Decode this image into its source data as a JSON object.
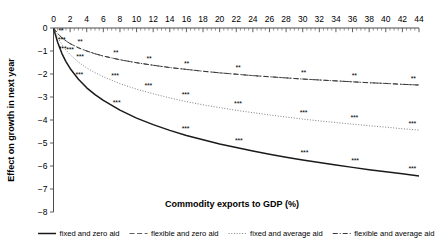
{
  "chart_data": {
    "type": "line",
    "title": "",
    "xlabel": "Commodity exports to GDP (%)",
    "ylabel": "Effect on growth in next year",
    "xlim": [
      0,
      44
    ],
    "ylim": [
      -8,
      0
    ],
    "grid": false,
    "legend_position": "bottom",
    "x_ticks": [
      0,
      2,
      4,
      6,
      8,
      10,
      12,
      14,
      16,
      18,
      20,
      22,
      24,
      26,
      28,
      30,
      32,
      34,
      36,
      38,
      40,
      42,
      44
    ],
    "x_tick_labels": [
      "0",
      "2",
      "4",
      "6",
      "8",
      "10",
      "12",
      "14",
      "16",
      "18",
      "20",
      "22",
      "24",
      "26",
      "28",
      "30",
      "32",
      "34",
      "36",
      "38",
      "40",
      "42",
      "44"
    ],
    "x_minor_tick_step": 0.5,
    "y_ticks": [
      0,
      -1,
      -2,
      -3,
      -4,
      -5,
      -6,
      -7,
      -8
    ],
    "y_tick_labels": [
      "0",
      "−1",
      "−2",
      "−3",
      "−4",
      "−5",
      "−6",
      "−7",
      "−8"
    ],
    "series": [
      {
        "name": "fixed and zero aid",
        "style": "solid",
        "color": "#1a1a1a",
        "x": [
          0,
          0.5,
          1,
          1.5,
          2,
          3,
          4,
          5,
          6,
          8,
          10,
          12,
          14,
          16,
          18,
          20,
          22,
          24,
          26,
          28,
          30,
          32,
          34,
          36,
          38,
          40,
          42,
          44
        ],
        "y": [
          0,
          -0.62,
          -1.1,
          -1.46,
          -1.76,
          -2.23,
          -2.6,
          -2.9,
          -3.15,
          -3.57,
          -3.92,
          -4.2,
          -4.45,
          -4.67,
          -4.86,
          -5.04,
          -5.2,
          -5.35,
          -5.49,
          -5.62,
          -5.74,
          -5.85,
          -5.96,
          -6.06,
          -6.16,
          -6.25,
          -6.34,
          -6.43
        ],
        "annotations": [
          {
            "x": 1.1,
            "y": -1.15,
            "text": "***"
          },
          {
            "x": 3.1,
            "y": -2.28,
            "text": "***"
          },
          {
            "x": 7.6,
            "y": -3.5,
            "text": "***"
          },
          {
            "x": 15.9,
            "y": -4.6,
            "text": "***"
          },
          {
            "x": 22.3,
            "y": -5.15,
            "text": "***"
          },
          {
            "x": 30.2,
            "y": -5.68,
            "text": "***"
          },
          {
            "x": 36.3,
            "y": -6.0,
            "text": "***"
          },
          {
            "x": 43.2,
            "y": -6.36,
            "text": "***"
          }
        ]
      },
      {
        "name": "flexible and zero aid",
        "style": "dashed",
        "color": "#555555",
        "x": [
          0,
          0.5,
          1,
          1.5,
          2,
          3,
          4,
          5,
          6,
          8,
          10,
          12,
          14,
          16,
          18,
          20,
          22,
          24,
          26,
          28,
          30,
          32,
          34,
          36,
          38,
          40,
          42,
          44
        ],
        "y": [
          0,
          -0.24,
          -0.42,
          -0.56,
          -0.68,
          -0.86,
          -1.0,
          -1.12,
          -1.22,
          -1.38,
          -1.51,
          -1.62,
          -1.72,
          -1.8,
          -1.88,
          -1.95,
          -2.01,
          -2.07,
          -2.12,
          -2.17,
          -2.22,
          -2.26,
          -2.3,
          -2.34,
          -2.38,
          -2.41,
          -2.45,
          -2.48
        ],
        "annotations": [
          {
            "x": 0.9,
            "y": -0.36,
            "text": "**"
          },
          {
            "x": 3.2,
            "y": -0.82,
            "text": "**"
          },
          {
            "x": 7.5,
            "y": -1.32,
            "text": "**"
          },
          {
            "x": 11.5,
            "y": -1.56,
            "text": "**"
          },
          {
            "x": 16.0,
            "y": -1.78,
            "text": "**"
          },
          {
            "x": 22.2,
            "y": -1.97,
            "text": "**"
          },
          {
            "x": 30.1,
            "y": -2.17,
            "text": "**"
          },
          {
            "x": 36.2,
            "y": -2.3,
            "text": "**"
          },
          {
            "x": 43.3,
            "y": -2.44,
            "text": "**"
          }
        ]
      },
      {
        "name": "fixed and average aid",
        "style": "dotted",
        "color": "#777777",
        "x": [
          0,
          0.5,
          1,
          1.5,
          2,
          3,
          4,
          5,
          6,
          8,
          10,
          12,
          14,
          16,
          18,
          20,
          22,
          24,
          26,
          28,
          30,
          32,
          34,
          36,
          38,
          40,
          42,
          44
        ],
        "y": [
          0,
          -0.4,
          -0.72,
          -0.96,
          -1.16,
          -1.48,
          -1.74,
          -1.94,
          -2.12,
          -2.42,
          -2.66,
          -2.86,
          -3.04,
          -3.2,
          -3.34,
          -3.46,
          -3.58,
          -3.68,
          -3.78,
          -3.87,
          -3.96,
          -4.04,
          -4.11,
          -4.18,
          -4.25,
          -4.31,
          -4.38,
          -4.44
        ],
        "annotations": [
          {
            "x": 1.0,
            "y": -0.76,
            "text": "***"
          },
          {
            "x": 2.0,
            "y": -1.2,
            "text": "***"
          },
          {
            "x": 3.2,
            "y": -1.5,
            "text": "***"
          },
          {
            "x": 7.4,
            "y": -2.3,
            "text": "***"
          },
          {
            "x": 11.4,
            "y": -2.74,
            "text": "***"
          },
          {
            "x": 15.9,
            "y": -3.15,
            "text": "***"
          },
          {
            "x": 22.2,
            "y": -3.54,
            "text": "***"
          },
          {
            "x": 30.1,
            "y": -3.9,
            "text": "***"
          },
          {
            "x": 36.2,
            "y": -4.12,
            "text": "***"
          },
          {
            "x": 43.2,
            "y": -4.38,
            "text": "***"
          }
        ]
      },
      {
        "name": "flexible and average aid",
        "style": "dashdot",
        "color": "#3a3a3a",
        "x": [
          0,
          0.5,
          1,
          1.5,
          2,
          3,
          4,
          5,
          6,
          8,
          10,
          12,
          14,
          16,
          18,
          20,
          22,
          24,
          26,
          28,
          30,
          32,
          34,
          36,
          38,
          40,
          42,
          44
        ],
        "y": [
          0,
          -0.24,
          -0.42,
          -0.56,
          -0.68,
          -0.86,
          -1.0,
          -1.12,
          -1.22,
          -1.38,
          -1.51,
          -1.62,
          -1.72,
          -1.8,
          -1.88,
          -1.95,
          -2.01,
          -2.07,
          -2.12,
          -2.17,
          -2.22,
          -2.26,
          -2.3,
          -2.34,
          -2.38,
          -2.41,
          -2.45,
          -2.48
        ],
        "annotations": []
      }
    ]
  },
  "axes": {
    "x_title": "Commodity exports to GDP (%)",
    "y_title": "Effect on growth in next year"
  },
  "legend": {
    "items": [
      {
        "label": "fixed and zero aid",
        "style": "solid"
      },
      {
        "label": "flexible and zero aid",
        "style": "dashed"
      },
      {
        "label": "fixed and average aid",
        "style": "dotted"
      },
      {
        "label": "flexible and average aid",
        "style": "dashdot"
      }
    ]
  }
}
